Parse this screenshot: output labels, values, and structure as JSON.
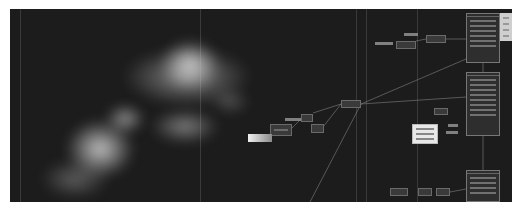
{
  "window": {
    "title": "Node graph editor",
    "canvas_bg": "#1c1c1c",
    "border_color": "#ffffff"
  },
  "viewer": {
    "content": "particle-render-preview",
    "description": "White particle streaks on black background"
  },
  "nodes": [
    {
      "id": "n1",
      "title": "",
      "x": 270,
      "y": 124,
      "w": 22,
      "h": 12
    },
    {
      "id": "n2",
      "title": "",
      "x": 301,
      "y": 114,
      "w": 12,
      "h": 8
    },
    {
      "id": "n3",
      "title": "",
      "x": 311,
      "y": 124,
      "w": 13,
      "h": 9
    },
    {
      "id": "n4",
      "title": "",
      "x": 341,
      "y": 100,
      "w": 20,
      "h": 8
    },
    {
      "id": "n5",
      "title": "",
      "x": 396,
      "y": 41,
      "w": 20,
      "h": 8
    },
    {
      "id": "n6",
      "title": "",
      "x": 426,
      "y": 35,
      "w": 20,
      "h": 8
    },
    {
      "id": "n7",
      "title": "",
      "x": 434,
      "y": 108,
      "w": 14,
      "h": 7
    },
    {
      "id": "n8",
      "title": "",
      "x": 390,
      "y": 188,
      "w": 18,
      "h": 8
    },
    {
      "id": "n9",
      "title": "",
      "x": 418,
      "y": 188,
      "w": 14,
      "h": 8
    },
    {
      "id": "n10",
      "title": "",
      "x": 436,
      "y": 188,
      "w": 14,
      "h": 8
    }
  ],
  "labels": [
    {
      "x": 375,
      "y": 42,
      "w": 18
    },
    {
      "x": 404,
      "y": 33,
      "w": 14
    },
    {
      "x": 285,
      "y": 118,
      "w": 16
    },
    {
      "x": 280,
      "y": 124,
      "w": 10
    },
    {
      "x": 448,
      "y": 124,
      "w": 10
    },
    {
      "x": 446,
      "y": 131,
      "w": 12
    }
  ],
  "panels": [
    {
      "id": "p1",
      "title": "",
      "x": 466,
      "y": 13,
      "w": 34,
      "h": 50,
      "rows": 7
    },
    {
      "id": "p2",
      "title": "",
      "x": 466,
      "y": 72,
      "w": 34,
      "h": 64,
      "rows": 8
    },
    {
      "id": "p3",
      "title": "",
      "x": 466,
      "y": 170,
      "w": 34,
      "h": 32,
      "rows": 4
    }
  ],
  "notes": [
    {
      "id": "note1",
      "x": 412,
      "y": 124,
      "w": 26,
      "h": 20,
      "rows": 3
    },
    {
      "id": "gradient",
      "x": 248,
      "y": 134,
      "w": 24,
      "h": 8
    }
  ],
  "side_panel": {
    "x": 500,
    "y": 13,
    "w": 12,
    "h": 28,
    "rows": 4
  }
}
